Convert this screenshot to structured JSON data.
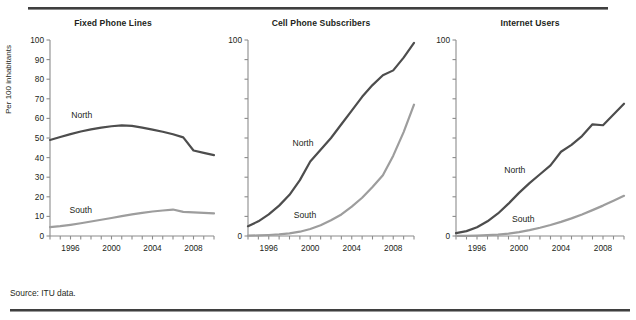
{
  "figure": {
    "source_note": "Source: ITU data.",
    "clipped_header": "",
    "y_axis_title": "Per 100 inhabitants",
    "series_colors": {
      "north": "#4d4d4d",
      "south": "#9d9d9d"
    },
    "axis_color": "#8c8c8c",
    "rule_color": "#3f3f3f"
  },
  "chart_data": [
    {
      "type": "line",
      "title": "Fixed Phone Lines",
      "xlabel": "",
      "ylabel": "Per 100 inhabitants",
      "xlim": [
        1994,
        2010
      ],
      "ylim": [
        0,
        100
      ],
      "ytick_values": [
        0,
        10,
        20,
        30,
        40,
        50,
        60,
        70,
        80,
        90,
        100
      ],
      "ytick_labels": [
        "0",
        "10",
        "20",
        "30",
        "40",
        "50",
        "60",
        "70",
        "80",
        "90",
        "100"
      ],
      "xtick_values": [
        1994,
        1996,
        1998,
        2000,
        2002,
        2004,
        2006,
        2008,
        2010
      ],
      "xtick_labels": [
        "",
        "1996",
        "",
        "2000",
        "",
        "2004",
        "",
        "2008",
        ""
      ],
      "grid": false,
      "legend": "inline-labels",
      "x": [
        1994,
        1995,
        1996,
        1997,
        1998,
        1999,
        2000,
        2001,
        2002,
        2003,
        2004,
        2005,
        2006,
        2007,
        2008,
        2009,
        2010
      ],
      "series": [
        {
          "name": "North",
          "color": "#4d4d4d",
          "label_x": 1997.1,
          "label_y": 60,
          "values": [
            49.0,
            50.5,
            52.0,
            53.3,
            54.4,
            55.3,
            56.0,
            56.4,
            56.2,
            55.3,
            54.3,
            53.2,
            51.9,
            50.3,
            43.6,
            42.4,
            41.3
          ]
        },
        {
          "name": "South",
          "color": "#9d9d9d",
          "label_x": 1997.0,
          "label_y": 11.5,
          "values": [
            4.5,
            5.0,
            5.7,
            6.5,
            7.4,
            8.3,
            9.2,
            10.1,
            11.0,
            11.8,
            12.5,
            13.0,
            13.5,
            12.3,
            12.1,
            11.8,
            11.5
          ]
        }
      ]
    },
    {
      "type": "line",
      "title": "Cell Phone Subscribers",
      "xlabel": "",
      "ylabel": "",
      "xlim": [
        1994,
        2010
      ],
      "ylim": [
        0,
        100
      ],
      "ytick_values": [
        0,
        10,
        20,
        30,
        40,
        50,
        60,
        70,
        80,
        90,
        100
      ],
      "ytick_labels": [
        "0",
        "",
        "",
        "",
        "",
        "",
        "",
        "",
        "",
        "",
        "100"
      ],
      "xtick_values": [
        1994,
        1996,
        1998,
        2000,
        2002,
        2004,
        2006,
        2008,
        2010
      ],
      "xtick_labels": [
        "",
        "1996",
        "",
        "2000",
        "",
        "2004",
        "",
        "2008",
        ""
      ],
      "grid": false,
      "legend": "inline-labels",
      "x": [
        1994,
        1995,
        1996,
        1997,
        1998,
        1999,
        2000,
        2001,
        2002,
        2003,
        2004,
        2005,
        2006,
        2007,
        2008,
        2009,
        2010
      ],
      "series": [
        {
          "name": "North",
          "color": "#4d4d4d",
          "label_x": 1999.3,
          "label_y": 46,
          "values": [
            5.0,
            7.5,
            11.0,
            15.5,
            21.0,
            28.5,
            38.0,
            44.0,
            50.0,
            57.0,
            64.0,
            71.0,
            77.0,
            82.0,
            84.5,
            91.0,
            98.5
          ]
        },
        {
          "name": "South",
          "color": "#9d9d9d",
          "label_x": 1999.5,
          "label_y": 9,
          "values": [
            0.2,
            0.3,
            0.5,
            0.8,
            1.3,
            2.2,
            3.6,
            5.5,
            8.0,
            11.0,
            15.0,
            19.5,
            25.0,
            31.0,
            41.0,
            53.0,
            67.0
          ]
        }
      ]
    },
    {
      "type": "line",
      "title": "Internet Users",
      "xlabel": "",
      "ylabel": "",
      "xlim": [
        1994,
        2010
      ],
      "ylim": [
        0,
        100
      ],
      "ytick_values": [
        0,
        10,
        20,
        30,
        40,
        50,
        60,
        70,
        80,
        90,
        100
      ],
      "ytick_labels": [
        "0",
        "",
        "",
        "",
        "",
        "",
        "",
        "",
        "",
        "",
        "100"
      ],
      "xtick_values": [
        1994,
        1996,
        1998,
        2000,
        2002,
        2004,
        2006,
        2008,
        2010
      ],
      "xtick_labels": [
        "",
        "1996",
        "",
        "2000",
        "",
        "2004",
        "",
        "2008",
        ""
      ],
      "grid": false,
      "legend": "inline-labels",
      "x": [
        1994,
        1995,
        1996,
        1997,
        1998,
        1999,
        2000,
        2001,
        2002,
        2003,
        2004,
        2005,
        2006,
        2007,
        2008,
        2009,
        2010
      ],
      "series": [
        {
          "name": "North",
          "color": "#4d4d4d",
          "label_x": 1999.6,
          "label_y": 32,
          "values": [
            1.5,
            2.5,
            4.5,
            7.5,
            11.5,
            16.5,
            22.0,
            27.0,
            31.5,
            36.0,
            43.0,
            46.5,
            51.0,
            57.0,
            56.5,
            62.0,
            67.5
          ]
        },
        {
          "name": "South",
          "color": "#9d9d9d",
          "label_x": 2000.4,
          "label_y": 7,
          "values": [
            0.05,
            0.1,
            0.2,
            0.4,
            0.7,
            1.2,
            2.0,
            3.0,
            4.2,
            5.6,
            7.2,
            9.0,
            11.0,
            13.2,
            15.5,
            18.0,
            20.5
          ]
        }
      ]
    }
  ]
}
